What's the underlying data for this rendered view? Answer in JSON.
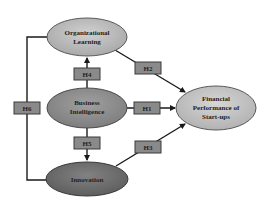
{
  "nodes": {
    "organizational_learning": {
      "line1": "Organizational",
      "line2": "Learning",
      "fill": "#b9b9b9"
    },
    "business_intelligence": {
      "line1": "Business",
      "line2": "Intelligence",
      "fill": "#8e8e8e"
    },
    "innovation": {
      "line1": "Innovation",
      "fill": "#6e6e6e"
    },
    "financial_performance": {
      "line1": "Financial",
      "line2": "Performance of",
      "line3": "Start-ups",
      "fill": "#c4c4c4"
    }
  },
  "hypotheses": {
    "h1": "H1",
    "h2": "H2",
    "h3": "H3",
    "h4": "H4",
    "h5": "H5",
    "h6": "H6"
  },
  "colors": {
    "line": "#1a1a1a",
    "hyp_box": "#8a8a8a",
    "hyp_border": "#3a3a3a"
  }
}
